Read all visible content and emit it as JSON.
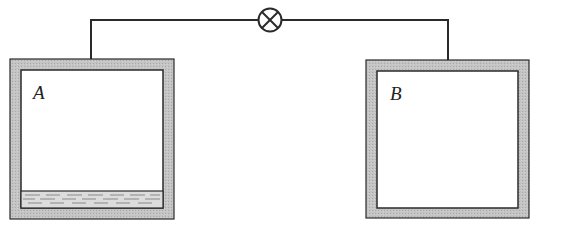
{
  "diagram": {
    "type": "two-container-valve",
    "containers": [
      {
        "id": "A",
        "label": "A",
        "contains_liquid": true
      },
      {
        "id": "B",
        "label": "B",
        "contains_liquid": false
      }
    ],
    "connection": {
      "type": "pipe",
      "valve": "closed-valve-symbol"
    },
    "colors": {
      "wall": "#bdbdbd",
      "outline": "#2a2a2a",
      "liquid": "#d6d6d6",
      "background": "#ffffff"
    }
  }
}
